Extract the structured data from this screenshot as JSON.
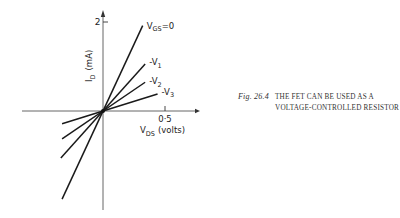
{
  "chart_data": {
    "type": "line",
    "title": "",
    "xlabel": "V_DS (volts)",
    "ylabel": "I_D (mA)",
    "x_ticks": [
      {
        "value": 0.5,
        "label": "0·5"
      }
    ],
    "y_ticks": [
      {
        "value": 2,
        "label": "2"
      }
    ],
    "xlim": [
      -0.65,
      0.78
    ],
    "ylim": [
      -2.2,
      2.15
    ],
    "grid": false,
    "legend": "inline-labels",
    "series": [
      {
        "name": "V_GS=0",
        "label_main": "V",
        "label_sub": "GS",
        "label_suffix": "=0",
        "slope_mA_per_V": 6.0,
        "x_range": [
          -0.33,
          0.32
        ]
      },
      {
        "name": "-V1",
        "label_main": "-V",
        "label_sub": "1",
        "label_suffix": "",
        "slope_mA_per_V": 3.1,
        "x_range": [
          -0.34,
          0.34
        ]
      },
      {
        "name": "-V2",
        "label_main": "-V",
        "label_sub": "2",
        "label_suffix": "",
        "slope_mA_per_V": 1.9,
        "x_range": [
          -0.33,
          0.34
        ]
      },
      {
        "name": "-V3",
        "label_main": "-V",
        "label_sub": "3",
        "label_suffix": "",
        "slope_mA_per_V": 0.87,
        "x_range": [
          -0.33,
          0.44
        ]
      }
    ],
    "axis_labels": {
      "y_main": "I",
      "y_sub": "D",
      "y_unit": "(mA)",
      "x_main": "V",
      "x_sub": "DS",
      "x_unit": "(volts)"
    }
  },
  "caption": {
    "figure_number": "Fig. 26.4",
    "text": "The FET can be used as a voltage-controlled resistor"
  }
}
